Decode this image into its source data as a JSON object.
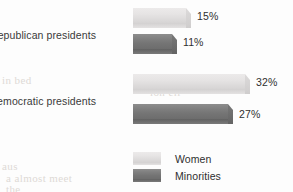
{
  "chart_data": {
    "type": "bar",
    "orientation": "horizontal",
    "title": "",
    "subtitle": "",
    "xlabel": "",
    "ylabel": "",
    "grid": false,
    "xlim": [
      0,
      40
    ],
    "categories": [
      "Republican presidents",
      "Democratic presidents"
    ],
    "series": [
      {
        "name": "Women",
        "color": "#e4e2e2",
        "values": [
          15,
          32
        ],
        "value_labels": [
          "15%",
          "32%"
        ]
      },
      {
        "name": "Minorities",
        "color": "#7a7a7a",
        "values": [
          11,
          27
        ],
        "value_labels": [
          "11%",
          "27%"
        ]
      }
    ],
    "legend": {
      "position": "bottom-left",
      "entries": [
        {
          "label": "Women",
          "color": "#e4e2e2"
        },
        {
          "label": "Minorities",
          "color": "#7a7a7a"
        }
      ]
    }
  },
  "bleed_through": [
    {
      "text": "in bed",
      "x": 2,
      "y": 74
    },
    {
      "text": "aus",
      "x": 2,
      "y": 160
    },
    {
      "text": "a almost meet",
      "x": 6,
      "y": 172
    },
    {
      "text": "the",
      "x": 6,
      "y": 183
    },
    {
      "text": "in hadn",
      "x": 150,
      "y": 72
    },
    {
      "text": "ion ell",
      "x": 150,
      "y": 86
    }
  ]
}
